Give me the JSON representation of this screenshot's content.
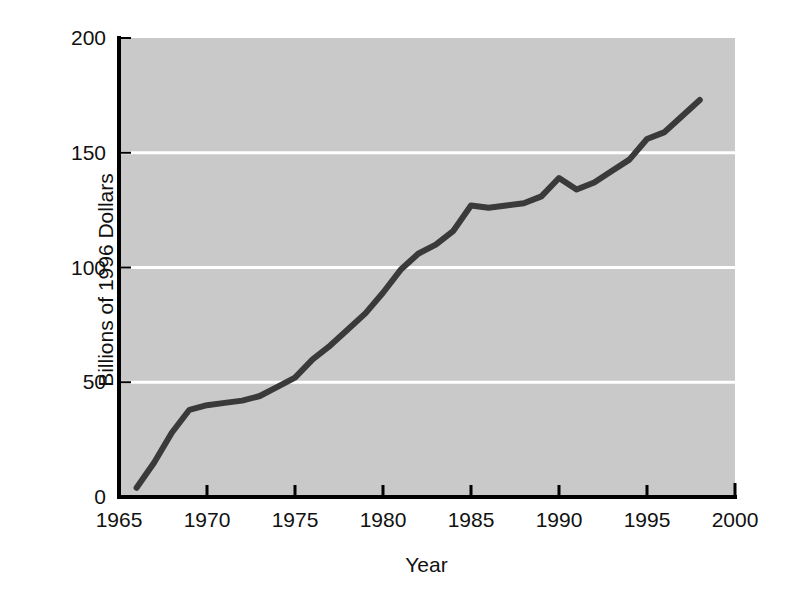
{
  "chart_data": {
    "type": "line",
    "title": "",
    "xlabel": "Year",
    "ylabel": "Billions of 1996 Dollars",
    "xlim": [
      1965,
      2000
    ],
    "ylim": [
      0,
      200
    ],
    "xticks": [
      "1965",
      "1970",
      "1975",
      "1980",
      "1985",
      "1990",
      "1995",
      "2000"
    ],
    "xtick_values": [
      1965,
      1970,
      1975,
      1980,
      1985,
      1990,
      1995,
      2000
    ],
    "yticks": [
      "0",
      "50",
      "100",
      "150",
      "200"
    ],
    "ytick_values": [
      0,
      50,
      100,
      150,
      200
    ],
    "grid": "horizontal-white-gridlines-at-50-100-150",
    "legend": "none",
    "plot_background_color": "#c9c9c9",
    "gridline_color": "#ffffff",
    "line_color": "#3a3a3a",
    "line_width": 6,
    "axis_color": "#000000",
    "x": [
      1966,
      1967,
      1968,
      1969,
      1970,
      1971,
      1972,
      1973,
      1974,
      1975,
      1976,
      1977,
      1978,
      1979,
      1980,
      1981,
      1982,
      1983,
      1984,
      1985,
      1986,
      1987,
      1988,
      1989,
      1990,
      1991,
      1992,
      1993,
      1994,
      1995,
      1996,
      1997,
      1998
    ],
    "values": [
      4,
      15,
      28,
      38,
      40,
      41,
      42,
      44,
      48,
      52,
      60,
      66,
      73,
      80,
      89,
      99,
      106,
      110,
      116,
      127,
      126,
      127,
      128,
      131,
      139,
      134,
      137,
      142,
      147,
      156,
      159,
      166,
      173
    ],
    "series": [
      {
        "name": "spending",
        "values": [
          4,
          15,
          28,
          38,
          40,
          41,
          42,
          44,
          48,
          52,
          60,
          66,
          73,
          80,
          89,
          99,
          106,
          110,
          116,
          127,
          126,
          127,
          128,
          131,
          139,
          134,
          137,
          142,
          147,
          156,
          159,
          166,
          173
        ]
      }
    ]
  }
}
